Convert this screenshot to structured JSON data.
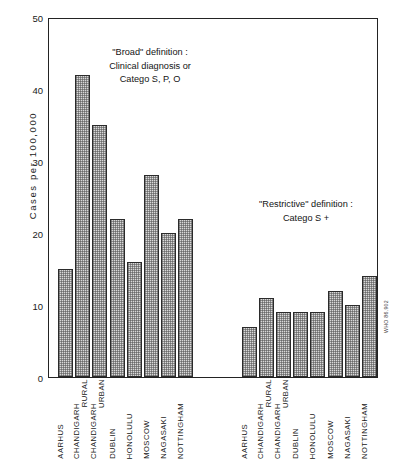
{
  "chart_data": {
    "type": "bar",
    "title": "",
    "xlabel": "",
    "ylabel": "Cases per 100,000",
    "ylim": [
      0,
      50
    ],
    "yticks": [
      0,
      10,
      20,
      30,
      40,
      50
    ],
    "grid": false,
    "legend_position": "none",
    "categories": [
      "AARHUS",
      "CHANDIGARH RURAL",
      "CHANDIGARH URBAN",
      "DUBLIN",
      "HONOLULU",
      "MOSCOW",
      "NAGASAKI",
      "NOTTINGHAM"
    ],
    "groups": [
      {
        "name": "\"Broad\" definition : Clinical diagnosis or Catego S, P, O",
        "values": [
          15,
          42,
          35,
          22,
          16,
          28,
          20,
          22
        ]
      },
      {
        "name": "\"Restrictive\" definition : Catego S +",
        "values": [
          7,
          11,
          9,
          9,
          9,
          12,
          10,
          14
        ]
      }
    ],
    "annotations": [
      {
        "id": "broad",
        "lines": [
          "\"Broad\" definition :",
          "Clinical diagnosis or",
          "Catego S, P, O"
        ]
      },
      {
        "id": "restrictive",
        "lines": [
          "\"Restrictive\" definition :",
          "Catego S +"
        ]
      }
    ],
    "category_label_lines": [
      [
        "AARHUS"
      ],
      [
        "CHANDIGARH",
        "RURAL"
      ],
      [
        "CHANDIGARH",
        "URBAN"
      ],
      [
        "DUBLIN"
      ],
      [
        "HONOLULU"
      ],
      [
        "MOSCOW"
      ],
      [
        "NAGASAKI"
      ],
      [
        "NOTTINGHAM"
      ]
    ],
    "bar_fill_color": "#d9d9d9",
    "bar_edge_color": "#2b2b2b",
    "axis_color": "#232323"
  },
  "watermark": {
    "text": "WHO 86.902"
  }
}
